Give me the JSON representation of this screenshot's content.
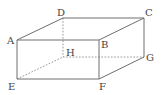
{
  "diagram": {
    "vertices": {
      "A": {
        "label": "A",
        "x": 17,
        "y": 40
      },
      "B": {
        "label": "B",
        "x": 99,
        "y": 40
      },
      "C": {
        "label": "C",
        "x": 144,
        "y": 18
      },
      "D": {
        "label": "D",
        "x": 63,
        "y": 18
      },
      "E": {
        "label": "E",
        "x": 17,
        "y": 79
      },
      "F": {
        "label": "F",
        "x": 99,
        "y": 79
      },
      "G": {
        "label": "G",
        "x": 144,
        "y": 57
      },
      "H": {
        "label": "H",
        "x": 63,
        "y": 57
      }
    },
    "visible_edges": [
      "AB",
      "BC",
      "CD",
      "DA",
      "AE",
      "EF",
      "BF",
      "FG",
      "CG"
    ],
    "hidden_edges": [
      "DH",
      "EH",
      "HG"
    ],
    "colors": {
      "edge": "#6e6e6e",
      "hidden_edge": "#8a8a8a",
      "label": "#444444"
    }
  }
}
